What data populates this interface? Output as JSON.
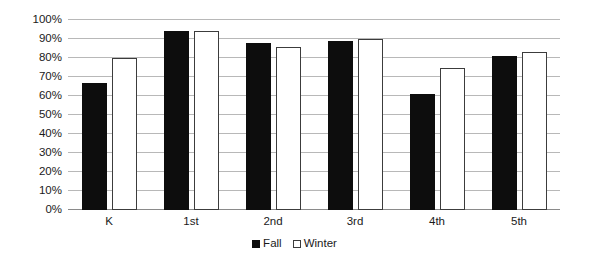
{
  "chart_data": {
    "type": "bar",
    "title": "",
    "subtitle": "",
    "xlabel": "",
    "ylabel": "",
    "categories": [
      "K",
      "1st",
      "2nd",
      "3rd",
      "4th",
      "5th"
    ],
    "series": [
      {
        "name": "Fall",
        "color": "#0d0d0d",
        "values": [
          67,
          94,
          88,
          89,
          61,
          81
        ]
      },
      {
        "name": "Winter",
        "color": "#ffffff",
        "values": [
          80,
          94,
          86,
          90,
          75,
          83
        ]
      }
    ],
    "ylim": [
      0,
      100
    ],
    "y_ticks": [
      0,
      10,
      20,
      30,
      40,
      50,
      60,
      70,
      80,
      90,
      100
    ],
    "y_tick_labels": [
      "0%",
      "10%",
      "20%",
      "30%",
      "40%",
      "50%",
      "60%",
      "70%",
      "80%",
      "90%",
      "100%"
    ],
    "grid": true,
    "grid_color": "#b8b8b8",
    "legend_position": "bottom",
    "legend": [
      {
        "label": "Fall",
        "swatch": "filled-black-square"
      },
      {
        "label": "Winter",
        "swatch": "outlined-white-square"
      }
    ]
  }
}
